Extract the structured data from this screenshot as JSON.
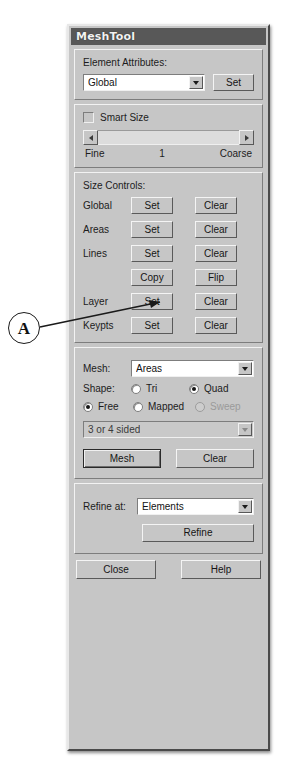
{
  "window": {
    "title": "MeshTool"
  },
  "element_attributes": {
    "group_label": "Element Attributes:",
    "selected": "Global",
    "options": [
      "Global"
    ],
    "set_label": "Set",
    "dropdown_icon": "chevron-down-icon"
  },
  "smart_size": {
    "checkbox_label": "Smart Size",
    "checked": false,
    "slider": {
      "left_arrow_icon": "arrow-left-icon",
      "right_arrow_icon": "arrow-right-icon",
      "min_label": "Fine",
      "value_label": "1",
      "max_label": "Coarse"
    }
  },
  "size_controls": {
    "group_label": "Size Controls:",
    "rows": [
      {
        "label": "Global",
        "set_label": "Set",
        "clear_label": "Clear"
      },
      {
        "label": "Areas",
        "set_label": "Set",
        "clear_label": "Clear"
      },
      {
        "label": "Lines",
        "set_label": "Set",
        "clear_label": "Clear"
      },
      {
        "label": "",
        "set_label": "Copy",
        "clear_label": "Flip"
      },
      {
        "label": "Layer",
        "set_label": "Set",
        "clear_label": "Clear"
      },
      {
        "label": "Keypts",
        "set_label": "Set",
        "clear_label": "Clear"
      }
    ]
  },
  "mesh_section": {
    "mesh_label": "Mesh:",
    "mesh_selected": "Areas",
    "mesh_options": [
      "Areas"
    ],
    "shape_label": "Shape:",
    "shape_options": [
      {
        "label": "Tri",
        "checked": false,
        "disabled": false
      },
      {
        "label": "Quad",
        "checked": true,
        "disabled": false
      }
    ],
    "mode_options": [
      {
        "label": "Free",
        "checked": true,
        "disabled": false
      },
      {
        "label": "Mapped",
        "checked": false,
        "disabled": false
      },
      {
        "label": "Sweep",
        "checked": false,
        "disabled": true
      }
    ],
    "sided_selected": "3 or 4 sided",
    "sided_disabled": true,
    "mesh_button_label": "Mesh",
    "clear_button_label": "Clear"
  },
  "refine_section": {
    "refine_at_label": "Refine at:",
    "selected": "Elements",
    "options": [
      "Elements"
    ],
    "refine_button_label": "Refine"
  },
  "footer": {
    "close_label": "Close",
    "help_label": "Help"
  },
  "annotation": {
    "marker": "A"
  }
}
